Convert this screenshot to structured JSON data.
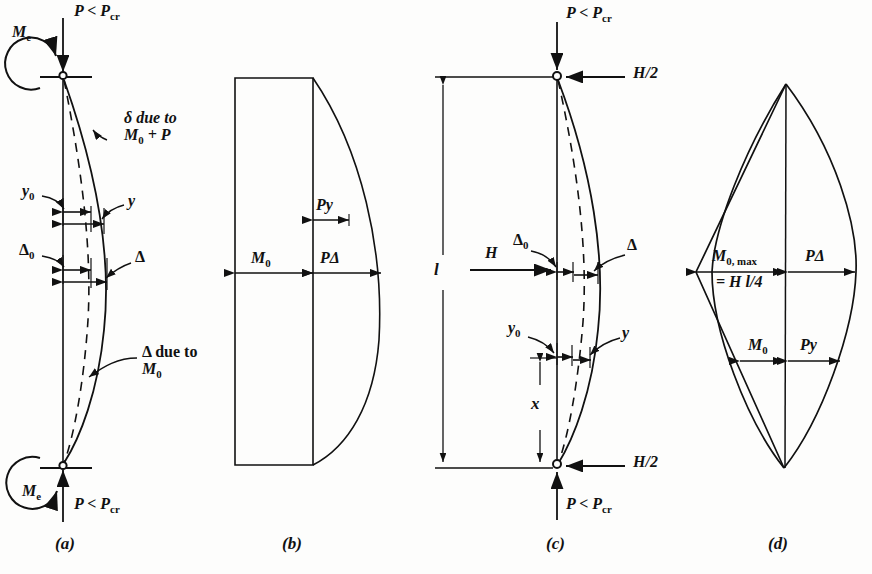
{
  "figure": {
    "type": "engineering-diagram",
    "background_color": "#fdfdfc",
    "line_color": "#111111"
  },
  "panels": [
    {
      "id": "a",
      "caption": "(a)",
      "kind": "deflected-shape",
      "labels": {
        "axial_top": "P < P",
        "axial_top_sub": "cr",
        "axial_bottom": "P < P",
        "axial_bottom_sub": "cr",
        "end_moment_top": "M",
        "end_moment_top_sub": "e",
        "end_moment_bottom": "M",
        "end_moment_bottom_sub": "e",
        "delta_note_line1": "δ due to",
        "delta_note_line2_a": "M",
        "delta_note_line2_sub": "0",
        "delta_note_line2_b": " + P",
        "y0": "y",
        "y0_sub": "0",
        "y": "y",
        "Delta0": "Δ",
        "Delta0_sub": "0",
        "Delta": "Δ",
        "big_delta_note_line1": "Δ due to",
        "big_delta_note_line2": "M",
        "big_delta_note_line2_sub": "0"
      }
    },
    {
      "id": "b",
      "caption": "(b)",
      "kind": "moment-diagram",
      "labels": {
        "M0": "M",
        "M0_sub": "0",
        "Py": "Py",
        "PDelta": "PΔ"
      }
    },
    {
      "id": "c",
      "caption": "(c)",
      "kind": "deflected-shape",
      "labels": {
        "axial_top": "P < P",
        "axial_top_sub": "cr",
        "axial_bottom": "P < P",
        "axial_bottom_sub": "cr",
        "shear_top": "H/2",
        "shear_bottom": "H/2",
        "length": "l",
        "lateral_load": "H",
        "station": "x",
        "Delta0": "Δ",
        "Delta0_sub": "0",
        "Delta": "Δ",
        "y0": "y",
        "y0_sub": "0",
        "y": "y"
      }
    },
    {
      "id": "d",
      "caption": "(d)",
      "kind": "moment-diagram",
      "labels": {
        "M0max_line1": "M",
        "M0max_line1_sub": "0, max",
        "M0max_line2": "= H l/4",
        "PDelta": "PΔ",
        "M0": "M",
        "M0_sub": "0",
        "Py": "Py"
      }
    }
  ]
}
